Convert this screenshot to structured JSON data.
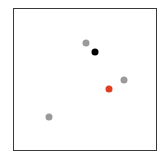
{
  "figure": {
    "frame": {
      "left": 13,
      "top": 8,
      "width": 144,
      "height": 143
    },
    "points": [
      {
        "name": "gray-dot-1",
        "x": 86,
        "y": 43,
        "color": "#9a9a9a"
      },
      {
        "name": "black-dot",
        "x": 95,
        "y": 52,
        "color": "#000000"
      },
      {
        "name": "gray-dot-2",
        "x": 124,
        "y": 80,
        "color": "#9a9a9a"
      },
      {
        "name": "red-dot",
        "x": 109,
        "y": 89,
        "color": "#e0401f"
      },
      {
        "name": "gray-dot-3",
        "x": 49,
        "y": 117,
        "color": "#9a9a9a"
      }
    ]
  }
}
